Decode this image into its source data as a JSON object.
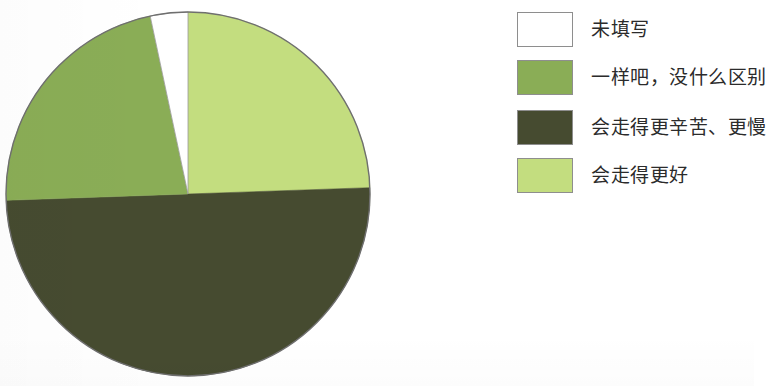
{
  "chart_data": {
    "type": "pie",
    "title": "",
    "subtitle": "",
    "xlabel": "",
    "ylabel": "",
    "legend_position": "right",
    "grid": false,
    "labels": [
      "未填写",
      "一样吧，没什么区别",
      "会走得更辛苦、更慢",
      "会走得更好"
    ],
    "colors": [
      "#ffffff",
      "#8aad56",
      "#464b30",
      "#c3dd7f"
    ],
    "values": [
      3.3,
      22.2,
      50.0,
      24.5
    ],
    "slice_order_clockwise_from_top": [
      "会走得更好",
      "会走得更辛苦、更慢",
      "一样吧，没什么区别",
      "未填写"
    ],
    "slice_angles_deg": {
      "会走得更好": 88,
      "会走得更辛苦、更慢": 180,
      "一样吧，没什么区别": 80,
      "未填写": 12
    }
  },
  "pie": {
    "center_x": 188,
    "center_y": 194,
    "radius": 182,
    "outline_color": "#6f6f6f",
    "slices": [
      {
        "name": "会走得更好",
        "color": "#c3dd7f",
        "start_deg": 0,
        "end_deg": 88
      },
      {
        "name": "会走得更辛苦、更慢",
        "color": "#464b30",
        "start_deg": 88,
        "end_deg": 268
      },
      {
        "name": "一样吧，没什么区别",
        "color": "#8aad56",
        "start_deg": 268,
        "end_deg": 348
      },
      {
        "name": "未填写",
        "color": "#ffffff",
        "start_deg": 348,
        "end_deg": 360
      }
    ]
  },
  "legend": {
    "items": [
      {
        "label": "未填写",
        "color": "#ffffff",
        "border": "#8e8e8e"
      },
      {
        "label": "一样吧，没什么区别",
        "color": "#8aad56",
        "border": "#8e8e8e"
      },
      {
        "label": "会走得更辛苦、更慢",
        "color": "#464b30",
        "border": "#8e8e8e"
      },
      {
        "label": "会走得更好",
        "color": "#c3dd7f",
        "border": "#8e8e8e"
      }
    ]
  }
}
